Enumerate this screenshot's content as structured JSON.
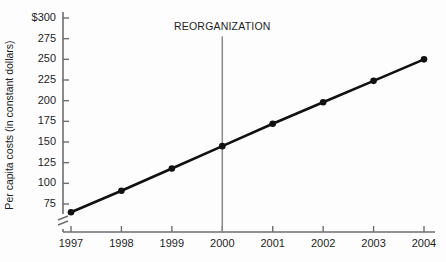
{
  "chart_data": {
    "type": "line",
    "title": "",
    "subtitle": "",
    "xlabel": "",
    "ylabel": "Per capita costs (in constant dollars)",
    "categories": [
      "1997",
      "1998",
      "1999",
      "2000",
      "2001",
      "2002",
      "2003",
      "2004"
    ],
    "x": [
      1997,
      1998,
      1999,
      2000,
      2001,
      2002,
      2003,
      2004
    ],
    "values": [
      65,
      91,
      118,
      145,
      172,
      198,
      224,
      250
    ],
    "series": [
      {
        "name": "Per capita costs",
        "values": [
          65,
          91,
          118,
          145,
          172,
          198,
          224,
          250
        ]
      }
    ],
    "ylim": [
      50,
      300
    ],
    "xlim": [
      1997,
      2004
    ],
    "y_ticks": [
      75,
      100,
      125,
      150,
      175,
      200,
      225,
      250,
      275,
      300
    ],
    "y_tick_labels": [
      "75",
      "100",
      "125",
      "150",
      "175",
      "200",
      "225",
      "250",
      "275",
      "$300"
    ],
    "x_ticks": [
      1997,
      1998,
      1999,
      2000,
      2001,
      2002,
      2003,
      2004
    ],
    "x_tick_labels": [
      "1997",
      "1998",
      "1999",
      "2000",
      "2001",
      "2002",
      "2003",
      "2004"
    ],
    "grid": false,
    "legend": false,
    "legend_position": "none",
    "axis_break": true,
    "axis_break_note": "y-axis broken below 75",
    "annotations": [
      {
        "text": "REORGANIZATION",
        "x": 2000,
        "type": "vertical-line-with-label",
        "label_y": 285
      }
    ],
    "colors": {
      "series_line": "#111111",
      "marker": "#111111",
      "axis": "#6e6e6e",
      "annotation_line": "#8a8a8a",
      "text": "#1d1d1d",
      "background": "#fdfdfd"
    }
  }
}
